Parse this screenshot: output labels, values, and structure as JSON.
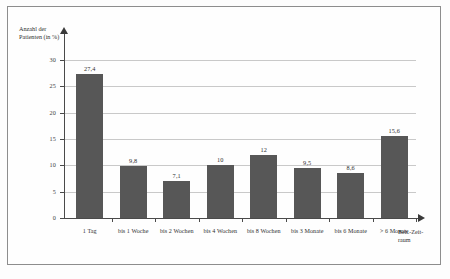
{
  "chart_data": {
    "type": "bar",
    "title": "",
    "subtitle": "",
    "xlabel": "Beh.-Zeitraum",
    "ylabel": "Anzahl der Patienten (in %)",
    "categories": [
      "1 Tag",
      "bis 1 Woche",
      "bis 2 Wochen",
      "bis 4 Wochen",
      "bis 8 Wochen",
      "bis 3 Monate",
      "bis 6 Monate",
      "> 6 Monate"
    ],
    "values": [
      27.4,
      9.8,
      7.1,
      10,
      12,
      9.5,
      8.6,
      15.6
    ],
    "value_labels": [
      "27,4",
      "9,8",
      "7,1",
      "10",
      "12",
      "9,5",
      "8,6",
      "15,6"
    ],
    "ylim": [
      0,
      30
    ],
    "yticks": [
      0,
      5,
      10,
      15,
      20,
      25,
      30
    ],
    "ytick_labels": [
      "0",
      "5",
      "10",
      "15",
      "20",
      "25",
      "30"
    ],
    "grid": true,
    "grid_axis": "y",
    "legend": false,
    "bar_color": "#575757",
    "gridline_color": "#c9c9c9",
    "axis_color": "#4a4a4a"
  },
  "axis_titles": {
    "y_line1": "Anzahl der",
    "y_line2": "Patienten (in %)",
    "x_line1": "Beh.-Zeit-",
    "x_line2": "raum"
  }
}
